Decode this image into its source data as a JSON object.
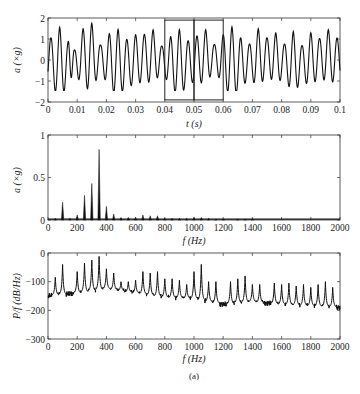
{
  "chart_data": [
    {
      "type": "line",
      "title": "",
      "xlabel": "t (s)",
      "ylabel": "a (×g)",
      "xlim": [
        0,
        0.1
      ],
      "ylim": [
        -2,
        2
      ],
      "xticks": [
        "0",
        "0.01",
        "0.02",
        "0.03",
        "0.04",
        "0.05",
        "0.06",
        "0.07",
        "0.08",
        "0.09",
        "0.1"
      ],
      "yticks": [
        "−2",
        "−1",
        "0",
        "1",
        "2"
      ],
      "grid": false,
      "description": "Oscillating acceleration time signal, amplitude roughly ±1.6 g, dominant period ~0.003 s",
      "annotations": [
        {
          "type": "rectangle",
          "x0": 0.04,
          "x1": 0.05,
          "y0": -1.9,
          "y1": 1.9
        },
        {
          "type": "rectangle",
          "x0": 0.05,
          "x1": 0.06,
          "y0": -1.9,
          "y1": 1.9
        }
      ],
      "peaks_sample": {
        "x": [
          0.001,
          0.004,
          0.007,
          0.009,
          0.012,
          0.015,
          0.018,
          0.021,
          0.024,
          0.027,
          0.03,
          0.033,
          0.036,
          0.039,
          0.042,
          0.045,
          0.048,
          0.051,
          0.054,
          0.057,
          0.06,
          0.063,
          0.066,
          0.069,
          0.072,
          0.075,
          0.078,
          0.081,
          0.084,
          0.087,
          0.09,
          0.093,
          0.096,
          0.099
        ],
        "y": [
          1.1,
          1.7,
          1.0,
          0.5,
          1.4,
          1.6,
          0.6,
          1.3,
          1.6,
          1.1,
          1.2,
          1.1,
          1.3,
          0.6,
          1.2,
          1.6,
          1.0,
          1.1,
          1.3,
          0.6,
          1.2,
          1.7,
          1.2,
          0.8,
          1.4,
          0.9,
          1.2,
          0.8,
          1.5,
          0.8,
          1.3,
          0.9,
          1.3,
          1.0
        ]
      }
    },
    {
      "type": "bar",
      "title": "",
      "xlabel": "f (Hz)",
      "ylabel": "a (×g)",
      "xlim": [
        0,
        2000
      ],
      "ylim": [
        0,
        1
      ],
      "xticks": [
        "0",
        "200",
        "400",
        "600",
        "800",
        "1000",
        "1200",
        "1400",
        "1600",
        "1800",
        "2000"
      ],
      "yticks": [
        "0",
        "0.5",
        "1"
      ],
      "grid": false,
      "frequencies": [
        50,
        100,
        150,
        200,
        250,
        300,
        350,
        400,
        450,
        500,
        550,
        600,
        650,
        700,
        750,
        800,
        850,
        900,
        950,
        1000,
        1050,
        1100,
        1150,
        1200,
        1300,
        1350,
        1400
      ],
      "values": [
        0.02,
        0.21,
        0.02,
        0.06,
        0.29,
        0.43,
        0.83,
        0.16,
        0.07,
        0.03,
        0.03,
        0.03,
        0.06,
        0.05,
        0.05,
        0.02,
        0.02,
        0.02,
        0.02,
        0.03,
        0.03,
        0.02,
        0.01,
        0.01,
        0.01,
        0.01,
        0.01
      ]
    },
    {
      "type": "line",
      "title": "",
      "xlabel": "f (Hz)",
      "ylabel": "P/f (dB/Hz)",
      "xlim": [
        0,
        2000
      ],
      "ylim": [
        -300,
        0
      ],
      "xticks": [
        "0",
        "200",
        "400",
        "600",
        "800",
        "1000",
        "1200",
        "1400",
        "1600",
        "1800",
        "2000"
      ],
      "yticks": [
        "−300",
        "−200",
        "−100",
        "0"
      ],
      "grid": false,
      "description": "Power spectral density with harmonic peaks every 50 Hz on a baseline falling from about −150 to −195 dB/Hz",
      "baseline": {
        "x": [
          0,
          200,
          400,
          600,
          800,
          1000,
          1200,
          1400,
          1600,
          1800,
          2000
        ],
        "y": [
          -150,
          -140,
          -125,
          -140,
          -155,
          -160,
          -180,
          -170,
          -180,
          -185,
          -190
        ]
      },
      "peaks": {
        "x": [
          50,
          100,
          200,
          250,
          300,
          350,
          400,
          450,
          500,
          550,
          600,
          650,
          700,
          750,
          800,
          850,
          900,
          950,
          1000,
          1050,
          1100,
          1150,
          1250,
          1300,
          1350,
          1400,
          1450,
          1550,
          1600,
          1650,
          1700,
          1750,
          1800,
          1850,
          1900,
          1950
        ],
        "y": [
          -85,
          -40,
          -65,
          -35,
          -25,
          -12,
          -55,
          -70,
          -100,
          -100,
          -95,
          -65,
          -70,
          -65,
          -90,
          -90,
          -95,
          -110,
          -65,
          -40,
          -100,
          -100,
          -100,
          -90,
          -80,
          -110,
          -110,
          -105,
          -110,
          -105,
          -115,
          -110,
          -120,
          -110,
          -100,
          -120
        ]
      }
    }
  ],
  "caption": "(a)"
}
